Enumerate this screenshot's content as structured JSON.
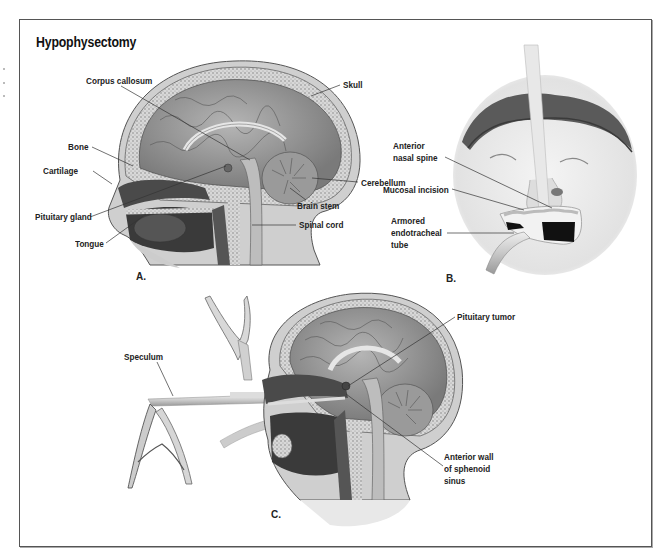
{
  "title": "Hypophysectomy",
  "panels": {
    "a": {
      "label": "A.",
      "labels": {
        "corpus_callosum": "Corpus callosum",
        "skull": "Skull",
        "bone": "Bone",
        "cartilage": "Cartilage",
        "cerebellum": "Cerebellum",
        "pituitary_gland": "Pituitary gland",
        "brain_stem": "Brain stem",
        "spinal_cord": "Spinal cord",
        "tongue": "Tongue"
      }
    },
    "b": {
      "label": "B.",
      "labels": {
        "anterior_nasal_spine_1": "Anterior",
        "anterior_nasal_spine_2": "nasal spine",
        "mucosal_incision": "Mucosal incision",
        "armored_tube_1": "Armored",
        "armored_tube_2": "endotracheal",
        "armored_tube_3": "tube"
      }
    },
    "c": {
      "label": "C.",
      "labels": {
        "pituitary_tumor": "Pituitary tumor",
        "speculum": "Speculum",
        "anterior_wall_1": "Anterior wall",
        "anterior_wall_2": "of sphenoid",
        "anterior_wall_3": "sinus"
      }
    }
  },
  "colors": {
    "frame": "#555555",
    "text": "#222222",
    "tissue_dark": "#3c3c3c",
    "tissue_mid": "#8a8a8a",
    "tissue_light": "#c8c8c8"
  }
}
